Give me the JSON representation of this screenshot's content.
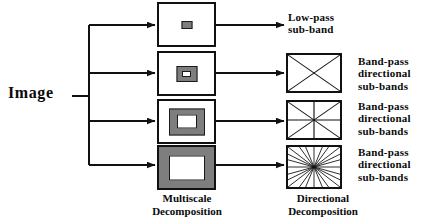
{
  "diagram": {
    "input_label": "Image",
    "colors": {
      "stroke": "#111111",
      "gray_fill": "#7e7e7e",
      "white_fill": "#ffffff",
      "text": "#0a0a0a"
    },
    "captions": {
      "multiscale": "Multiscale\nDecomposition",
      "directional": "Directional\nDecomposition"
    },
    "outputs": [
      {
        "id": "low-pass",
        "label": "Low-pass\nsub-band"
      },
      {
        "id": "band-pass-1",
        "label": "Band-pass\ndirectional\nsub-bands"
      },
      {
        "id": "band-pass-2",
        "label": "Band-pass\ndirectional\nsub-bands"
      },
      {
        "id": "band-pass-3",
        "label": "Band-pass\ndirectional\nsub-bands"
      }
    ],
    "multiscale_levels": [
      {
        "id": "level-1",
        "scale": 1,
        "inner": "solid-chip",
        "fill": "#7e7e7e"
      },
      {
        "id": "level-2",
        "scale": 2,
        "inner": "small-ring",
        "fill": "#7e7e7e"
      },
      {
        "id": "level-3",
        "scale": 3,
        "inner": "medium-ring",
        "fill": "#7e7e7e"
      },
      {
        "id": "level-4",
        "scale": 4,
        "inner": "full-field",
        "fill": "#7e7e7e"
      }
    ],
    "directional_levels": [
      {
        "id": "dir-1",
        "directions": 4,
        "pattern": "two-diagonals"
      },
      {
        "id": "dir-2",
        "directions": 8,
        "pattern": "four-lines"
      },
      {
        "id": "dir-3",
        "directions": 16,
        "pattern": "radial-fan"
      }
    ]
  }
}
